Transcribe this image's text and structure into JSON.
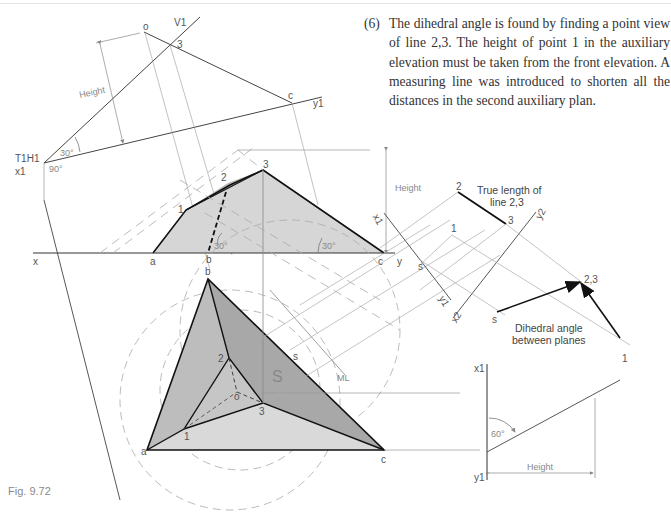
{
  "figure": {
    "caption": "Fig. 9.72",
    "description_number": "(6)",
    "description_text": "The dihedral angle is found by finding a point view of line 2,3. The height of point 1 in the auxiliary elevation must be taken from the front elevation. A measuring line was introduced to shorten all the distances in the second auxiliary plan."
  },
  "labels": {
    "first_aux": {
      "o": "o",
      "v1": "V1",
      "p3": "3",
      "c": "c",
      "y1": "y1",
      "height": "Height",
      "angle30": "30°",
      "t1h1": "T1H1",
      "x1": "x1",
      "angle90": "90°"
    },
    "elevation": {
      "x": "x",
      "a": "a",
      "b": "b",
      "c": "c",
      "y": "y",
      "p1": "1",
      "p2": "2",
      "p3": "3",
      "angle_left": "30°",
      "angle_right": "30°",
      "height": "Height"
    },
    "plan": {
      "a": "a",
      "b": "b",
      "c": "c",
      "p1": "1",
      "p2": "2",
      "p3": "3",
      "o": "o",
      "s": "s",
      "S": "S",
      "ML": "ML"
    },
    "second_aux": {
      "x1": "x1",
      "y1": "y1",
      "s": "s",
      "p1": "1",
      "p2": "2",
      "p3": "3",
      "x2": "x2",
      "y2": "y2",
      "s2": "s",
      "p23": "2,3",
      "p1b": "1",
      "true_length_line1": "True length of",
      "true_length_line2": "line 2,3",
      "dihedral_line1": "Dihedral angle",
      "dihedral_line2": "between planes"
    },
    "side_view": {
      "x1": "x1",
      "y1": "y1",
      "angle60": "60°",
      "height": "Height"
    }
  },
  "colors": {
    "outline": "#111111",
    "construction": "#9a9a9a",
    "fill_light": "#d9d9d9",
    "fill_mid": "#c4c4c4",
    "fill_dark": "#a8a8a8",
    "text": "#333333",
    "label_grey": "#8a8a8a"
  }
}
